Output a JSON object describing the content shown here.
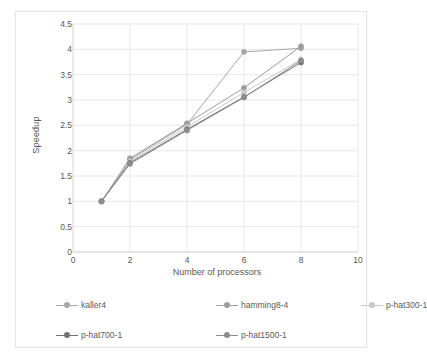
{
  "chart_data": {
    "type": "line",
    "title": "",
    "xlabel": "Number of processors",
    "ylabel": "Speedup",
    "xlim": [
      0,
      10
    ],
    "ylim": [
      0,
      4.5
    ],
    "xticks": [
      0,
      2,
      4,
      6,
      8,
      10
    ],
    "yticks": [
      0,
      0.5,
      1,
      1.5,
      2,
      2.5,
      3,
      3.5,
      4,
      4.5
    ],
    "xtick_labels": [
      "0",
      "2",
      "4",
      "6",
      "8",
      "10"
    ],
    "ytick_labels": [
      "0",
      "0.5",
      "1",
      "1.5",
      "2",
      "2.5",
      "3",
      "3.5",
      "4",
      "4.5"
    ],
    "grid": "horizontal-and-vertical-light",
    "legend_position": "bottom",
    "x": [
      1,
      2,
      4,
      6,
      8
    ],
    "series": [
      {
        "name": "kaller4",
        "color": "#a6a6a6",
        "values": [
          1.0,
          1.82,
          2.52,
          3.95,
          4.02
        ]
      },
      {
        "name": "hamming8-4",
        "color": "#9c9c9c",
        "values": [
          1.0,
          1.85,
          2.54,
          3.24,
          4.06
        ]
      },
      {
        "name": "p-hat300-1",
        "color": "#c9c9c9",
        "values": [
          1.0,
          1.79,
          2.47,
          3.15,
          3.8
        ]
      },
      {
        "name": "p-hat700-1",
        "color": "#737373",
        "values": [
          1.0,
          1.76,
          2.42,
          3.06,
          3.74
        ]
      },
      {
        "name": "p-hat1500-1",
        "color": "#8c8c8c",
        "values": [
          1.0,
          1.74,
          2.4,
          3.05,
          3.78
        ]
      }
    ]
  },
  "legend": {
    "items": [
      {
        "label": "kaller4"
      },
      {
        "label": "hamming8-4"
      },
      {
        "label": "p-hat300-1"
      },
      {
        "label": "p-hat700-1"
      },
      {
        "label": "p-hat1500-1"
      }
    ]
  },
  "colors": {
    "grid": "#e8e8e8",
    "axis": "#d4d4d4",
    "text": "#595959",
    "frame_border": "#e3e3e3",
    "background": "#ffffff"
  }
}
